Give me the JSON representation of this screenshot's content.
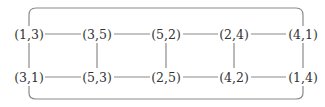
{
  "diagram": {
    "type": "graph",
    "colors": {
      "edge": "#8a8a8a",
      "text": "#333333",
      "background": "#ffffff"
    },
    "nodes": [
      {
        "id": "n13",
        "label": "(1,3)",
        "x": 29,
        "y": 34
      },
      {
        "id": "n35",
        "label": "(3,5)",
        "x": 97,
        "y": 34
      },
      {
        "id": "n52",
        "label": "(5,2)",
        "x": 166,
        "y": 34
      },
      {
        "id": "n24",
        "label": "(2,4)",
        "x": 234,
        "y": 34
      },
      {
        "id": "n41",
        "label": "(4,1)",
        "x": 302,
        "y": 34
      },
      {
        "id": "n31",
        "label": "(3,1)",
        "x": 29,
        "y": 77
      },
      {
        "id": "n53",
        "label": "(5,3)",
        "x": 97,
        "y": 77
      },
      {
        "id": "n25",
        "label": "(2,5)",
        "x": 166,
        "y": 77
      },
      {
        "id": "n42",
        "label": "(4,2)",
        "x": 234,
        "y": 77
      },
      {
        "id": "n14",
        "label": "(1,4)",
        "x": 302,
        "y": 77
      }
    ],
    "edges": [
      [
        "(1,3)",
        "(3,5)"
      ],
      [
        "(3,5)",
        "(5,2)"
      ],
      [
        "(5,2)",
        "(2,4)"
      ],
      [
        "(2,4)",
        "(4,1)"
      ],
      [
        "(3,1)",
        "(5,3)"
      ],
      [
        "(5,3)",
        "(2,5)"
      ],
      [
        "(2,5)",
        "(4,2)"
      ],
      [
        "(4,2)",
        "(1,4)"
      ],
      [
        "(1,3)",
        "(3,1)"
      ],
      [
        "(3,5)",
        "(5,3)"
      ],
      [
        "(5,2)",
        "(2,5)"
      ],
      [
        "(2,4)",
        "(4,2)"
      ],
      [
        "(4,1)",
        "(1,4)"
      ],
      [
        "(1,3)",
        "(4,1)"
      ],
      [
        "(3,1)",
        "(1,4)"
      ]
    ]
  }
}
